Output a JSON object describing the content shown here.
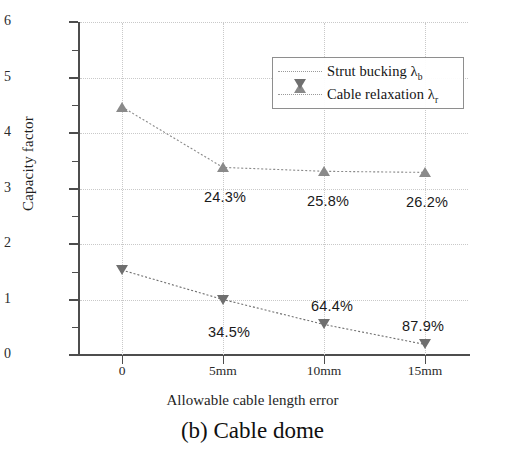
{
  "figure": {
    "caption": "(b) Cable dome"
  },
  "chart_data": {
    "type": "line",
    "title": "",
    "subtitle": "",
    "xlabel": "Allowable cable length error",
    "ylabel": "Capacity factor",
    "categories": [
      "0",
      "5mm",
      "10mm",
      "15mm"
    ],
    "ylim": [
      0,
      6
    ],
    "xlim": [
      -0.5,
      3.5
    ],
    "y_ticks": [
      "0",
      "1",
      "2",
      "3",
      "4",
      "5",
      "6"
    ],
    "y_minor_ticks": [
      0.5,
      1.5,
      2.5,
      3.5,
      4.5,
      5.5
    ],
    "grid": "dotted both axes",
    "legend_position": "upper right inside",
    "series": [
      {
        "name": "Strut bucking λ",
        "name_sub": "b",
        "marker": "triangle-up",
        "color": "#8a8a8a",
        "line_style": "dotted",
        "values": [
          4.47,
          3.38,
          3.31,
          3.29
        ],
        "point_labels": [
          "",
          "24.3%",
          "25.8%",
          "26.2%"
        ]
      },
      {
        "name": "Cable relaxation λ",
        "name_sub": "r",
        "marker": "triangle-down",
        "color": "#6f6f6f",
        "line_style": "dotted",
        "values": [
          1.53,
          1.0,
          0.55,
          0.19
        ],
        "point_labels": [
          "",
          "34.5%",
          "64.4%",
          "87.9%"
        ]
      }
    ],
    "annotations": [
      {
        "text": "24.3%",
        "series": 0,
        "x_index": 1
      },
      {
        "text": "25.8%",
        "series": 0,
        "x_index": 2
      },
      {
        "text": "26.2%",
        "series": 0,
        "x_index": 3
      },
      {
        "text": "34.5%",
        "series": 1,
        "x_index": 1
      },
      {
        "text": "64.4%",
        "series": 1,
        "x_index": 2
      },
      {
        "text": "87.9%",
        "series": 1,
        "x_index": 3
      }
    ]
  },
  "legend": {
    "items": [
      {
        "label": "Strut bucking λ",
        "sub": "b",
        "marker": "triangle-up-icon"
      },
      {
        "label": "Cable relaxation λ",
        "sub": "r",
        "marker": "triangle-down-icon"
      }
    ]
  },
  "colors": {
    "axis": "#4d4d4d",
    "grid": "#c9c9c9",
    "series_1": "#8a8a8a",
    "series_2": "#6f6f6f",
    "text": "#1a1a1a"
  }
}
